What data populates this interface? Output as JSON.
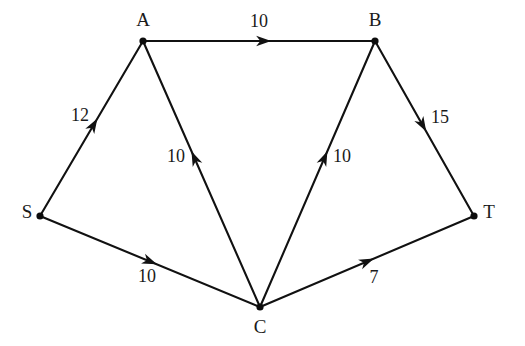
{
  "diagram": {
    "type": "directed-graph",
    "background_color": "#ffffff",
    "line_color": "#111111",
    "text_color": "#1a1a1a",
    "nodes": [
      {
        "id": "S",
        "label": "S",
        "x": 40,
        "y": 216,
        "label_x": 27,
        "label_y": 214
      },
      {
        "id": "A",
        "label": "A",
        "x": 143,
        "y": 41,
        "label_x": 143,
        "label_y": 22
      },
      {
        "id": "B",
        "label": "B",
        "x": 375,
        "y": 41,
        "label_x": 375,
        "label_y": 22
      },
      {
        "id": "C",
        "label": "C",
        "x": 260,
        "y": 307,
        "label_x": 260,
        "label_y": 329
      },
      {
        "id": "T",
        "label": "T",
        "x": 474,
        "y": 216,
        "label_x": 489,
        "label_y": 214
      }
    ],
    "edges": [
      {
        "id": "S-A",
        "from": "S",
        "to": "A",
        "capacity": "12",
        "label_x": 80,
        "label_y": 117,
        "arrow_t": 0.52
      },
      {
        "id": "A-B",
        "from": "A",
        "to": "B",
        "capacity": "10",
        "label_x": 259,
        "label_y": 23,
        "arrow_t": 0.52
      },
      {
        "id": "B-T",
        "from": "B",
        "to": "T",
        "capacity": "15",
        "label_x": 440,
        "label_y": 119,
        "arrow_t": 0.48
      },
      {
        "id": "S-C",
        "from": "S",
        "to": "C",
        "capacity": "10",
        "label_x": 147,
        "label_y": 278,
        "arrow_t": 0.5
      },
      {
        "id": "C-T",
        "from": "C",
        "to": "T",
        "capacity": "7",
        "label_x": 374,
        "label_y": 279,
        "arrow_t": 0.5
      },
      {
        "id": "C-A",
        "from": "C",
        "to": "A",
        "capacity": "10",
        "label_x": 176,
        "label_y": 158,
        "arrow_t": 0.56
      },
      {
        "id": "C-B",
        "from": "C",
        "to": "B",
        "capacity": "10",
        "label_x": 342,
        "label_y": 158,
        "arrow_t": 0.56
      }
    ]
  }
}
